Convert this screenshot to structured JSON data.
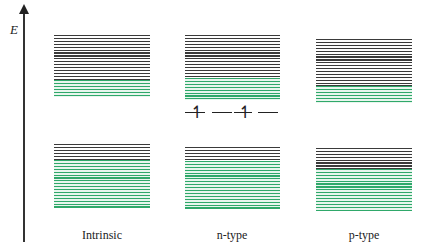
{
  "axis": {
    "label": "E",
    "direction": "up"
  },
  "colors": {
    "filled_state": "#2fa86a",
    "empty_state": "#3a3a3a",
    "background": "#ffffff"
  },
  "panels": [
    {
      "id": "intrinsic",
      "label": "Intrinsic",
      "upper_band": {
        "x": 54,
        "y": 35,
        "w": 96,
        "gray_h": 45,
        "green_h": 17
      },
      "lower_band": {
        "x": 54,
        "y": 144,
        "w": 96,
        "gray_h": 16,
        "green_h": 48
      }
    },
    {
      "id": "n-type",
      "label": "n-type",
      "upper_band": {
        "x": 185,
        "y": 35,
        "w": 95,
        "gray_h": 43,
        "green_h": 22
      },
      "lower_band": {
        "x": 185,
        "y": 147,
        "w": 95,
        "gray_h": 14,
        "green_h": 48
      },
      "donor_level": {
        "y": 112,
        "marks": [
          "↿",
          "↿"
        ]
      }
    },
    {
      "id": "p-type",
      "label": "p-type",
      "upper_band": {
        "x": 316,
        "y": 39,
        "w": 96,
        "gray_h": 47,
        "green_h": 17
      },
      "lower_band": {
        "x": 316,
        "y": 148,
        "w": 96,
        "gray_h": 21,
        "green_h": 42
      }
    }
  ]
}
